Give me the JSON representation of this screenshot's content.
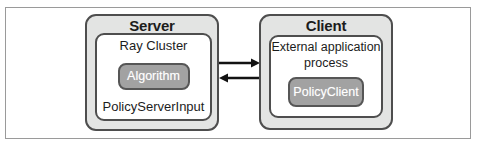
{
  "diagram": {
    "server": {
      "title": "Server",
      "cluster_label": "Ray Cluster",
      "component_label": "Algorithm",
      "input_label": "PolicyServerInput"
    },
    "client": {
      "title": "Client",
      "process_label": "External application process",
      "component_label": "PolicyClient"
    },
    "arrows": [
      {
        "name": "server-to-client",
        "direction": "right"
      },
      {
        "name": "client-to-server",
        "direction": "left"
      }
    ],
    "colors": {
      "group_fill": "#e3e4e3",
      "group_border": "#4e4e4e",
      "inner_fill": "#ffffff",
      "component_fill": "#a2a2a2",
      "component_border": "#565656",
      "component_text": "#ffffff",
      "arrow": "#121212",
      "frame_border": "#9a9a9a",
      "text": "#1c1c1c"
    }
  }
}
